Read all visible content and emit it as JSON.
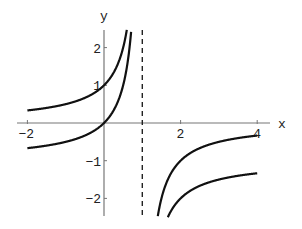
{
  "chart_data": {
    "type": "line",
    "title": "",
    "xlabel": "x",
    "ylabel": "y",
    "xlim": [
      -2,
      4
    ],
    "ylim": [
      -2.5,
      2.5
    ],
    "x_ticks": [
      -2,
      2,
      4
    ],
    "x_tick_labels": [
      "-2",
      "2",
      "4"
    ],
    "y_ticks": [
      -2,
      -1,
      1,
      2
    ],
    "y_tick_labels": [
      "-2",
      "-1",
      "1",
      "2"
    ],
    "grid": false,
    "legend": null,
    "asymptote": {
      "orientation": "vertical",
      "x": 1,
      "style": "dashed"
    },
    "series": [
      {
        "name": "1/(1-x)",
        "x": [
          -2,
          -1,
          0,
          0.5,
          0.6,
          1.4,
          1.5,
          2,
          3,
          4
        ],
        "values": [
          0.333,
          0.5,
          1,
          2,
          2.5,
          -2.5,
          -2,
          -1,
          -0.5,
          -0.333
        ]
      },
      {
        "name": "x/(1-x)",
        "x": [
          -2,
          -1,
          0,
          0.5,
          0.714,
          1.667,
          2,
          3,
          4
        ],
        "values": [
          -0.667,
          -0.5,
          0,
          1,
          2.5,
          -2.5,
          -2,
          -1.5,
          -1.333
        ]
      }
    ]
  },
  "axes": {
    "x_label": "x",
    "y_label": "y"
  },
  "colors": {
    "curve": "#111111",
    "axis": "#777777",
    "asymptote": "#222222",
    "background": "#ffffff"
  }
}
